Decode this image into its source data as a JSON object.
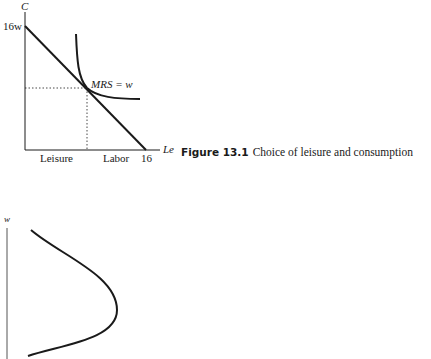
{
  "figure_top": {
    "caption_number": "Figure 13.1",
    "caption_text": "Choice of leisure and consumption",
    "y_axis_label": "C",
    "y_intercept_label": "16w",
    "x_axis_label": "Le",
    "x_intercept_label": "16",
    "leisure_label": "Leisure",
    "labor_label": "Labor",
    "tangency_label": "MRS = w"
  },
  "figure_bottom": {
    "y_axis_label": "w"
  },
  "colors": {
    "ink": "#1a1a1a",
    "background": "#ffffff"
  }
}
